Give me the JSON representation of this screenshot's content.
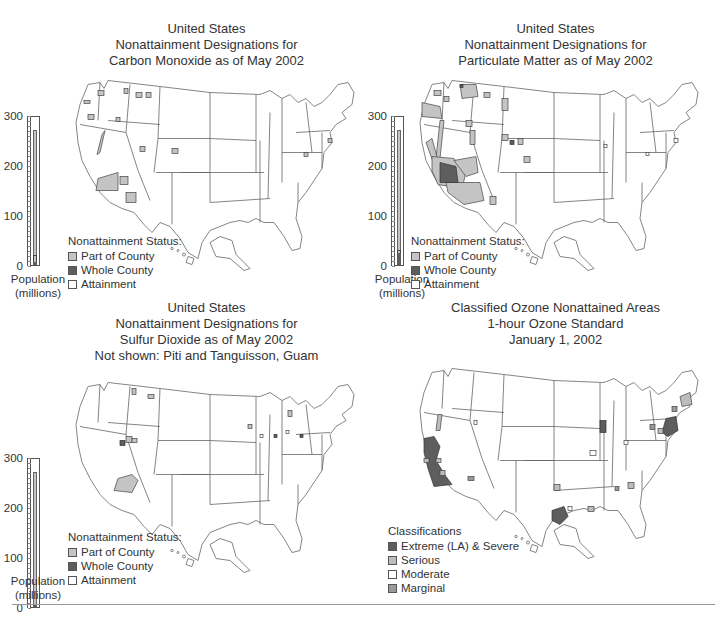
{
  "colors": {
    "part_of_county": "#c4c4c4",
    "whole_county": "#5e5e5e",
    "attainment": "#ffffff",
    "extreme_severe": "#5e5e5e",
    "serious": "#bdbdbd",
    "moderate": "#ffffff",
    "marginal": "#9a9a9a",
    "outline": "#555555"
  },
  "panels": [
    {
      "title_lines": [
        "United States",
        "Nonattainment Designations for",
        "Carbon Monoxide as of May 2002"
      ],
      "legend_title": "Nonattainment Status:",
      "legend_items": [
        "Part of County",
        "Whole County",
        "Attainment"
      ],
      "population_axis_ticks": [
        "300",
        "200",
        "100",
        "0"
      ],
      "population_label_1": "Population",
      "population_label_2": "(millions)"
    },
    {
      "title_lines": [
        "United States",
        "Nonattainment Designations for",
        "Particulate Matter as of May 2002"
      ],
      "legend_title": "Nonattainment Status:",
      "legend_items": [
        "Part of County",
        "Whole County",
        "Attainment"
      ],
      "population_axis_ticks": [
        "300",
        "200",
        "100",
        "0"
      ],
      "population_label_1": "Population",
      "population_label_2": "(millions)"
    },
    {
      "title_lines": [
        "United States",
        "Nonattainment Designations for",
        "Sulfur Dioxide as of May 2002",
        "Not shown: Piti and Tanguisson, Guam"
      ],
      "legend_title": "Nonattainment Status:",
      "legend_items": [
        "Part of County",
        "Whole County",
        "Attainment"
      ],
      "population_axis_ticks": [
        "300",
        "200",
        "100",
        "0"
      ],
      "population_label_1": "Population",
      "population_label_2": "(millions)"
    },
    {
      "title_lines": [
        "Classified Ozone Nonattained Areas",
        "1-hour Ozone Standard",
        "January 1, 2002"
      ],
      "legend_title": "Classifications",
      "legend_items": [
        "Extreme (LA) & Severe",
        "Serious",
        "Moderate",
        "Marginal"
      ]
    }
  ],
  "chart_data": [
    {
      "type": "bar",
      "title": "United States Nonattainment Designations for Carbon Monoxide as of May 2002",
      "xlabel": "",
      "ylabel": "Population (millions)",
      "ylim": [
        0,
        300
      ],
      "yticks": [
        0,
        100,
        200,
        300
      ],
      "categories": [
        "Population"
      ],
      "series": [
        {
          "name": "Whole County",
          "values": [
            5
          ]
        },
        {
          "name": "Part of County",
          "values": [
            15
          ]
        },
        {
          "name": "Attainment",
          "values": [
            250
          ]
        }
      ],
      "legend": [
        "Part of County",
        "Whole County",
        "Attainment"
      ],
      "legend_position": "bottom-left"
    },
    {
      "type": "bar",
      "title": "United States Nonattainment Designations for Particulate Matter as of May 2002",
      "xlabel": "",
      "ylabel": "Population (millions)",
      "ylim": [
        0,
        300
      ],
      "yticks": [
        0,
        100,
        200,
        300
      ],
      "categories": [
        "Population"
      ],
      "series": [
        {
          "name": "Whole County",
          "values": [
            24
          ]
        },
        {
          "name": "Part of County",
          "values": [
            6
          ]
        },
        {
          "name": "Attainment",
          "values": [
            240
          ]
        }
      ],
      "legend": [
        "Part of County",
        "Whole County",
        "Attainment"
      ],
      "legend_position": "bottom-left"
    },
    {
      "type": "bar",
      "title": "United States Nonattainment Designations for Sulfur Dioxide as of May 2002",
      "subtitle": "Not shown: Piti and Tanguisson, Guam",
      "xlabel": "",
      "ylabel": "Population (millions)",
      "ylim": [
        0,
        300
      ],
      "yticks": [
        0,
        100,
        200,
        300
      ],
      "categories": [
        "Population"
      ],
      "series": [
        {
          "name": "Whole County",
          "values": [
            1
          ]
        },
        {
          "name": "Part of County",
          "values": [
            3
          ]
        },
        {
          "name": "Attainment",
          "values": [
            266
          ]
        }
      ],
      "legend": [
        "Part of County",
        "Whole County",
        "Attainment"
      ],
      "legend_position": "bottom-left"
    },
    {
      "type": "heatmap",
      "title": "Classified Ozone Nonattained Areas 1-hour Ozone Standard January 1, 2002",
      "legend_title": "Classifications",
      "legend": [
        "Extreme (LA) & Severe",
        "Serious",
        "Moderate",
        "Marginal"
      ],
      "legend_position": "bottom-left"
    }
  ]
}
